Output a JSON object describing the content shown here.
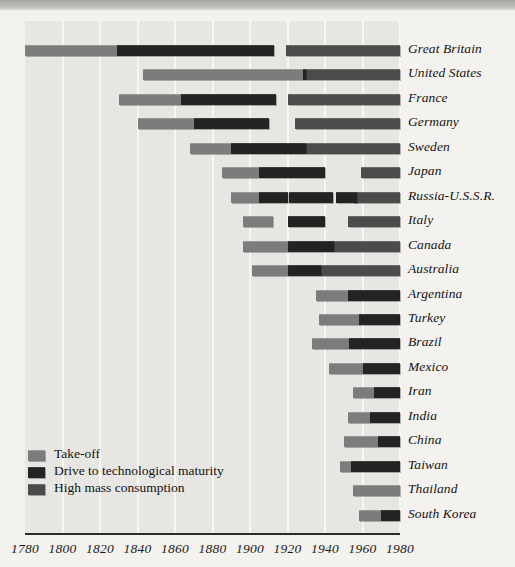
{
  "figure": {
    "title": "",
    "legend_items": [
      {
        "key": "takeoff",
        "label": "Take-off",
        "color": "#7c7c7c"
      },
      {
        "key": "drive",
        "label": "Drive to technological maturity",
        "color": "#232323"
      },
      {
        "key": "mass",
        "label": "High mass consumption",
        "color": "#4b4b4b"
      }
    ]
  },
  "chart_data": {
    "type": "bar",
    "subtype": "gantt-timeline",
    "title": "",
    "xlabel": "",
    "ylabel": "",
    "xlim": [
      1780,
      1980
    ],
    "grid": true,
    "legend_position": "bottom-left",
    "xticks": [
      1780,
      1800,
      1820,
      1840,
      1860,
      1880,
      1900,
      1920,
      1940,
      1960,
      1980
    ],
    "xtick_labels": [
      "1780",
      "1800",
      "1820",
      "1840",
      "1860",
      "1880",
      "1900",
      "1920",
      "1940",
      "1960",
      "1980"
    ],
    "categories": [
      "Great Britain",
      "United States",
      "France",
      "Germany",
      "Sweden",
      "Japan",
      "Russia-U.S.S.R.",
      "Italy",
      "Canada",
      "Australia",
      "Argentina",
      "Turkey",
      "Brazil",
      "Mexico",
      "Iran",
      "India",
      "China",
      "Taiwan",
      "Thailand",
      "South Korea"
    ],
    "series": [
      {
        "name": "Take-off",
        "key": "takeoff",
        "color": "#7c7c7c"
      },
      {
        "name": "Drive to technological maturity",
        "key": "drive",
        "color": "#232323"
      },
      {
        "name": "High mass consumption",
        "key": "mass",
        "color": "#4b4b4b"
      }
    ],
    "rows": [
      {
        "country": "Great Britain",
        "bars": [
          {
            "phase": "takeoff",
            "start": 1780,
            "end": 1829
          },
          {
            "phase": "drive",
            "start": 1829,
            "end": 1913
          },
          {
            "phase": "mass",
            "start": 1919,
            "end": 1980
          }
        ]
      },
      {
        "country": "United States",
        "bars": [
          {
            "phase": "takeoff",
            "start": 1843,
            "end": 1928
          },
          {
            "phase": "drive",
            "start": 1928,
            "end": 1930
          },
          {
            "phase": "mass",
            "start": 1930,
            "end": 1980
          }
        ]
      },
      {
        "country": "France",
        "bars": [
          {
            "phase": "takeoff",
            "start": 1830,
            "end": 1863
          },
          {
            "phase": "drive",
            "start": 1863,
            "end": 1914
          },
          {
            "phase": "mass",
            "start": 1920,
            "end": 1980
          }
        ]
      },
      {
        "country": "Germany",
        "bars": [
          {
            "phase": "takeoff",
            "start": 1840,
            "end": 1870
          },
          {
            "phase": "drive",
            "start": 1870,
            "end": 1910
          },
          {
            "phase": "mass",
            "start": 1924,
            "end": 1980
          }
        ]
      },
      {
        "country": "Sweden",
        "bars": [
          {
            "phase": "takeoff",
            "start": 1868,
            "end": 1890
          },
          {
            "phase": "drive",
            "start": 1890,
            "end": 1930
          },
          {
            "phase": "mass",
            "start": 1930,
            "end": 1980
          }
        ]
      },
      {
        "country": "Japan",
        "bars": [
          {
            "phase": "takeoff",
            "start": 1885,
            "end": 1905
          },
          {
            "phase": "drive",
            "start": 1905,
            "end": 1940
          },
          {
            "phase": "mass",
            "start": 1959,
            "end": 1980
          }
        ]
      },
      {
        "country": "Russia-U.S.S.R.",
        "bars": [
          {
            "phase": "takeoff",
            "start": 1890,
            "end": 1905
          },
          {
            "phase": "drive",
            "start": 1905,
            "end": 1920
          },
          {
            "phase": "drive",
            "start": 1921,
            "end": 1944
          },
          {
            "phase": "drive",
            "start": 1946,
            "end": 1957
          },
          {
            "phase": "mass",
            "start": 1955,
            "end": 1980
          }
        ]
      },
      {
        "country": "Italy",
        "bars": [
          {
            "phase": "takeoff",
            "start": 1896,
            "end": 1912
          },
          {
            "phase": "drive",
            "start": 1920,
            "end": 1940
          },
          {
            "phase": "mass",
            "start": 1952,
            "end": 1980
          }
        ]
      },
      {
        "country": "Canada",
        "bars": [
          {
            "phase": "takeoff",
            "start": 1896,
            "end": 1920
          },
          {
            "phase": "drive",
            "start": 1920,
            "end": 1945
          },
          {
            "phase": "mass",
            "start": 1945,
            "end": 1980
          }
        ]
      },
      {
        "country": "Australia",
        "bars": [
          {
            "phase": "takeoff",
            "start": 1901,
            "end": 1920
          },
          {
            "phase": "drive",
            "start": 1920,
            "end": 1938
          },
          {
            "phase": "mass",
            "start": 1938,
            "end": 1980
          }
        ]
      },
      {
        "country": "Argentina",
        "bars": [
          {
            "phase": "takeoff",
            "start": 1935,
            "end": 1952
          },
          {
            "phase": "drive",
            "start": 1952,
            "end": 1980
          }
        ]
      },
      {
        "country": "Turkey",
        "bars": [
          {
            "phase": "takeoff",
            "start": 1937,
            "end": 1958
          },
          {
            "phase": "drive",
            "start": 1958,
            "end": 1980
          }
        ]
      },
      {
        "country": "Brazil",
        "bars": [
          {
            "phase": "takeoff",
            "start": 1933,
            "end": 1953
          },
          {
            "phase": "drive",
            "start": 1953,
            "end": 1980
          }
        ]
      },
      {
        "country": "Mexico",
        "bars": [
          {
            "phase": "takeoff",
            "start": 1942,
            "end": 1960
          },
          {
            "phase": "drive",
            "start": 1960,
            "end": 1980
          }
        ]
      },
      {
        "country": "Iran",
        "bars": [
          {
            "phase": "takeoff",
            "start": 1955,
            "end": 1966
          },
          {
            "phase": "drive",
            "start": 1966,
            "end": 1980
          }
        ]
      },
      {
        "country": "India",
        "bars": [
          {
            "phase": "takeoff",
            "start": 1952,
            "end": 1964
          },
          {
            "phase": "drive",
            "start": 1964,
            "end": 1980
          }
        ]
      },
      {
        "country": "China",
        "bars": [
          {
            "phase": "takeoff",
            "start": 1950,
            "end": 1968
          },
          {
            "phase": "drive",
            "start": 1968,
            "end": 1980
          }
        ]
      },
      {
        "country": "Taiwan",
        "bars": [
          {
            "phase": "takeoff",
            "start": 1948,
            "end": 1954
          },
          {
            "phase": "drive",
            "start": 1954,
            "end": 1980
          }
        ]
      },
      {
        "country": "Thailand",
        "bars": [
          {
            "phase": "takeoff",
            "start": 1955,
            "end": 1980
          }
        ]
      },
      {
        "country": "South Korea",
        "bars": [
          {
            "phase": "takeoff",
            "start": 1958,
            "end": 1970
          },
          {
            "phase": "drive",
            "start": 1970,
            "end": 1980
          }
        ]
      }
    ]
  }
}
